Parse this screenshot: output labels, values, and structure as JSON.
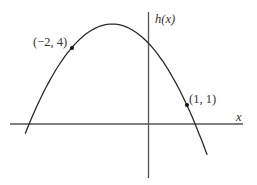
{
  "chart_data": {
    "type": "line",
    "title": "",
    "xlabel": "x",
    "ylabel": "h(x)",
    "function": "h(x) = -1.12 (x + 0.95)^2 + 5.26 (estimated downward parabola)",
    "series": [
      {
        "name": "h(x)",
        "x": [
          -3.0,
          -2.5,
          -2.0,
          -1.5,
          -1.0,
          -0.95,
          -0.5,
          0.0,
          0.5,
          1.0,
          1.5
        ],
        "values": [
          0.55,
          2.57,
          4.0,
          4.92,
          5.26,
          5.26,
          5.03,
          4.25,
          2.91,
          1.0,
          -1.46
        ]
      }
    ],
    "labeled_points": [
      {
        "x": -2,
        "y": 4,
        "label": "(−2, 4)"
      },
      {
        "x": 1,
        "y": 1,
        "label": "(1, 1)"
      }
    ],
    "xlim": [
      -3.1,
      2.85
    ],
    "ylim": [
      -2.6,
      6.4
    ],
    "grid": false,
    "legend": null
  },
  "labels": {
    "y_axis": "h(x)",
    "x_axis": "x",
    "point_a": "(−2, 4)",
    "point_b": "(1, 1)"
  }
}
